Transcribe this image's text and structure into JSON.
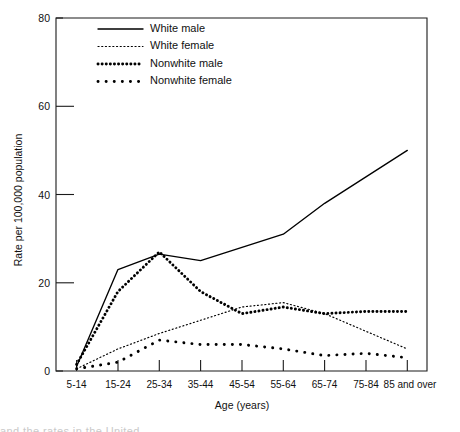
{
  "chart_data": {
    "type": "line",
    "title": "",
    "xlabel": "Age (years)",
    "ylabel": "Rate per 100,000 population",
    "categories": [
      "5-14",
      "15-24",
      "25-34",
      "35-44",
      "45-54",
      "55-64",
      "65-74",
      "75-84",
      "85 and over"
    ],
    "ylim": [
      0,
      80
    ],
    "yticks": [
      0,
      20,
      40,
      60,
      80
    ],
    "grid": false,
    "legend_position": "top-left-inside",
    "series": [
      {
        "name": "White male",
        "style": "solid",
        "values": [
          1,
          23,
          26.5,
          25,
          28,
          31,
          38,
          44,
          50
        ]
      },
      {
        "name": "White female",
        "style": "fine-dotted",
        "values": [
          0.5,
          5,
          8.5,
          11.5,
          14.5,
          15.5,
          13,
          9,
          5
        ]
      },
      {
        "name": "Nonwhite male",
        "style": "thick-dense-dotted",
        "values": [
          1.5,
          18,
          27,
          18,
          13,
          14.5,
          13,
          13.5,
          13.5
        ]
      },
      {
        "name": "Nonwhite female",
        "style": "thick-sparse-dotted",
        "values": [
          0.5,
          2,
          7,
          6,
          6,
          5,
          3.5,
          4,
          3
        ]
      }
    ]
  },
  "axes": {
    "y_tick_labels": [
      "0",
      "20",
      "40",
      "60",
      "80"
    ],
    "x_tick_labels": [
      "5-14",
      "15-24",
      "25-34",
      "35-44",
      "45-54",
      "55-64",
      "65-74",
      "75-84",
      "85 and over"
    ],
    "y_axis_title": "Rate per 100,000 population",
    "x_axis_title": "Age (years)"
  },
  "legend": {
    "items": [
      {
        "label": "White male"
      },
      {
        "label": "White female"
      },
      {
        "label": "Nonwhite male"
      },
      {
        "label": "Nonwhite female"
      }
    ]
  },
  "caption": {
    "clipped_text": "and the rates in the United"
  },
  "colors": {
    "ink": "#111111",
    "background": "#ffffff"
  }
}
